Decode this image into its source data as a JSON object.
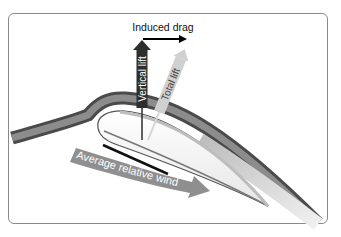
{
  "figure": {
    "type": "aerodynamics-diagram"
  },
  "labels": {
    "induced_drag": "Induced drag",
    "vertical_lift": "Vertical lift",
    "total_lift": "Total lift",
    "relative_wind": "Average relative wind"
  },
  "colors": {
    "frame": "#8a8a8a",
    "airflow_dark": "#4a4a4a",
    "airflow_mid": "#8c8c8c",
    "airfoil_fill": "#f2f2f2",
    "vertical_lift_arrow": "#2e2e2e",
    "total_lift_arrow": "#d0d0d0",
    "relative_wind_arrow": "#8f8f8f",
    "induced_drag_arrow": "#000000"
  }
}
